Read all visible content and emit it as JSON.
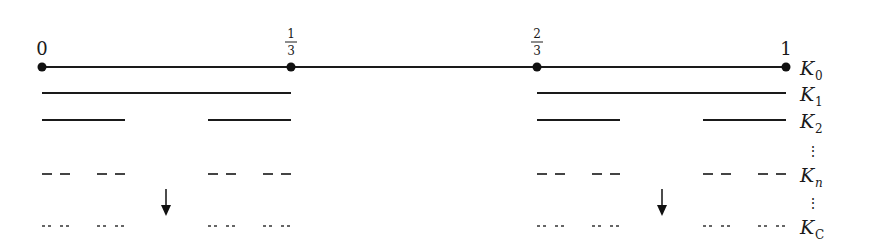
{
  "tick_labels": [
    {
      "text": "0",
      "x": 42
    },
    {
      "num": "1",
      "den": "3",
      "x": 291
    },
    {
      "num": "2",
      "den": "3",
      "x": 537
    },
    {
      "text": "1",
      "x": 786
    }
  ],
  "rows": [
    {
      "label": "K",
      "sub": "0",
      "y": 67,
      "style": "solid-dots"
    },
    {
      "label": "K",
      "sub": "1",
      "y": 93,
      "style": "solid"
    },
    {
      "label": "K",
      "sub": "2",
      "y": 120,
      "style": "solid"
    },
    {
      "label": "K",
      "sub": "n",
      "y": 174,
      "style": "dashed"
    },
    {
      "label": "K",
      "sub": "C",
      "y": 226,
      "style": "dotted"
    }
  ],
  "ellipsis": [
    "⋮",
    "⋮"
  ],
  "arrows": [
    {
      "x": 166
    },
    {
      "x": 662
    }
  ],
  "colors": {
    "line": "#1a1a1a",
    "dash": "#555555"
  }
}
